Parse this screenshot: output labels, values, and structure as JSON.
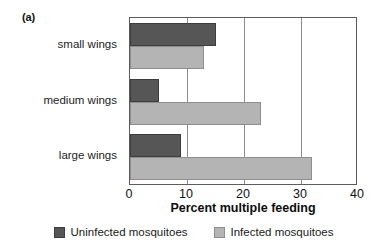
{
  "panel": {
    "label": "(a)"
  },
  "chart_data": {
    "type": "bar",
    "orientation": "horizontal",
    "title": "",
    "subtitle": "",
    "xlabel": "Percent multiple feeding",
    "ylabel": "",
    "xlim": [
      0,
      40
    ],
    "xticks": [
      0,
      10,
      20,
      30,
      40
    ],
    "xtick_labels": [
      "0",
      "10",
      "20",
      "30",
      "40"
    ],
    "grid": "vertical",
    "legend_position": "bottom-center",
    "categories": [
      "small wings",
      "medium wings",
      "large wings"
    ],
    "series": [
      {
        "name": "Uninfected mosquitoes",
        "color": "#565656",
        "values": [
          15,
          5,
          9
        ]
      },
      {
        "name": "Infected mosquitoes",
        "color": "#b4b4b4",
        "values": [
          13,
          23,
          32
        ]
      }
    ]
  },
  "legend": {
    "items": [
      {
        "label": "Uninfected mosquitoes",
        "swatch": "dark"
      },
      {
        "label": "Infected mosquitoes",
        "swatch": "light"
      }
    ]
  }
}
